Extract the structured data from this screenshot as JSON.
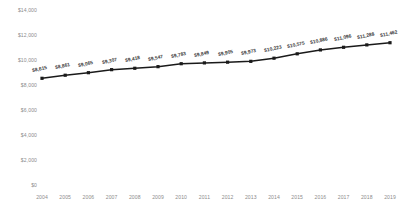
{
  "chart_data": {
    "type": "line",
    "title": "",
    "subtitle": "",
    "xlabel": "",
    "ylabel": "",
    "grid": false,
    "legend": "none",
    "marker": "square",
    "line_color": "#1a1a1a",
    "marker_color": "#1a1a1a",
    "label_color": "#3a3a3a",
    "axis_label_color": "#8c8c8c",
    "background_color": "#ffffff",
    "ylim": [
      0,
      14000
    ],
    "y_ticks": [
      0,
      2000,
      4000,
      6000,
      8000,
      10000,
      12000,
      14000
    ],
    "y_tick_labels": [
      "$0",
      "$2,000",
      "$4,000",
      "$6,000",
      "$8,000",
      "$10,000",
      "$12,000",
      "$14,000"
    ],
    "categories": [
      "2004",
      "2005",
      "2006",
      "2007",
      "2008",
      "2009",
      "2010",
      "2011",
      "2012",
      "2013",
      "2014",
      "2015",
      "2016",
      "2017",
      "2018",
      "2019"
    ],
    "values": [
      8615,
      8861,
      9065,
      9307,
      9418,
      9547,
      9783,
      9849,
      9905,
      9973,
      10223,
      10575,
      10886,
      11096,
      11288,
      11462
    ],
    "data_labels": [
      "$8,615",
      "$8,861",
      "$9,065",
      "$9,307",
      "$9,418",
      "$9,547",
      "$9,783",
      "$9,849",
      "$9,905",
      "$9,973",
      "$10,223",
      "$10,575",
      "$10,886",
      "$11,096",
      "$11,288",
      "$11,462"
    ]
  }
}
